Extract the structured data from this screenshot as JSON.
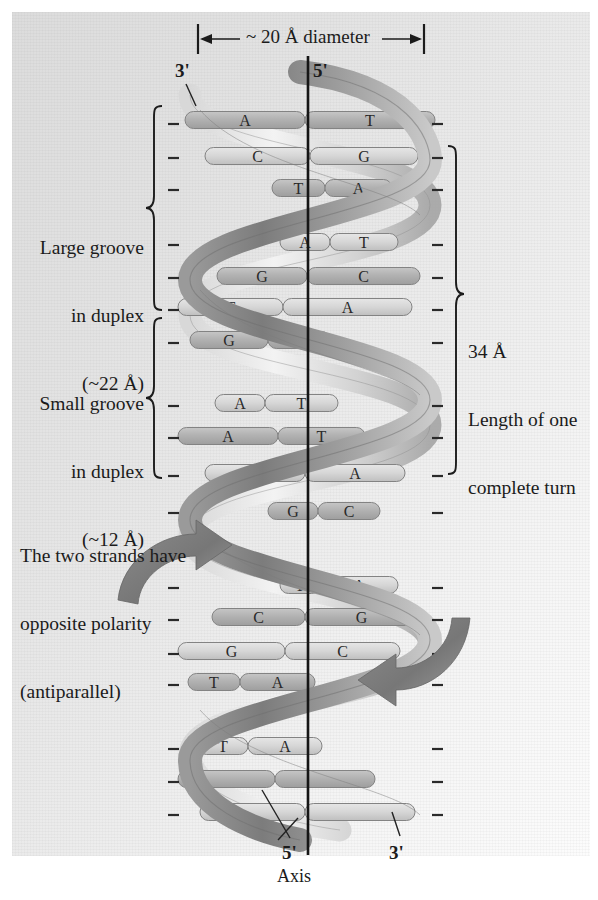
{
  "figure": {
    "background_color": "#e9e9e9",
    "ribbon_color_dark": "#8a8a8a",
    "ribbon_color_light": "#f2f2f2",
    "rung_color": "#b4b4b4",
    "text_color": "#1b1b1b"
  },
  "dimension_top": {
    "label": "~ 20 Å diameter",
    "arrow_left_x": 198,
    "arrow_right_x": 424
  },
  "strand_ends": {
    "top_left": "3'",
    "top_right": "5'",
    "bottom_left": "5'",
    "bottom_right": "3'"
  },
  "axis": {
    "label": "Axis",
    "x": 308,
    "top_y": 56,
    "bottom_y": 855
  },
  "annotations": {
    "large_groove": "Large groove\nin duplex\n(~22 Å)",
    "large_groove_lines": [
      "Large groove",
      "in duplex",
      "(~22 Å)"
    ],
    "small_groove": "Small groove\nin duplex\n(~12 Å)",
    "small_groove_lines": [
      "Small groove",
      "in duplex",
      "(~12 Å)"
    ],
    "antiparallel_lines": [
      "The two strands have",
      "opposite polarity",
      "(antiparallel)"
    ],
    "turn_length_lines": [
      "34 Å",
      "Length of one",
      "complete turn"
    ]
  },
  "chart_data": {
    "type": "diagram",
    "subtype": "dna-double-helix",
    "helix_diameter_angstrom": 20,
    "turn_length_angstrom": 34,
    "major_groove_angstrom": 22,
    "minor_groove_angstrom": 12,
    "base_pairs": [
      {
        "left": "A",
        "right": "T",
        "y": 120,
        "x1": 185,
        "x2": 435,
        "split": 305,
        "visible": "full"
      },
      {
        "left": "C",
        "right": "G",
        "y": 156,
        "x1": 205,
        "x2": 418,
        "split": 310,
        "visible": "full"
      },
      {
        "left": "T",
        "right": "A",
        "y": 188,
        "x1": 272,
        "x2": 392,
        "split": 325,
        "visible": "partial"
      },
      {
        "left": "A",
        "right": "T",
        "y": 242,
        "x1": 280,
        "x2": 398,
        "split": 330,
        "visible": "partial"
      },
      {
        "left": "G",
        "right": "C",
        "y": 276,
        "x1": 217,
        "x2": 420,
        "split": 307,
        "visible": "full"
      },
      {
        "left": "T",
        "right": "A",
        "y": 307,
        "x1": 178,
        "x2": 412,
        "split": 283,
        "visible": "full"
      },
      {
        "left": "G",
        "right": "C",
        "y": 340,
        "x1": 190,
        "x2": 330,
        "split": 268,
        "visible": "partial"
      },
      {
        "left": "A",
        "right": "T",
        "y": 403,
        "x1": 215,
        "x2": 338,
        "split": 265,
        "visible": "partial"
      },
      {
        "left": "A",
        "right": "T",
        "y": 436,
        "x1": 178,
        "x2": 365,
        "split": 278,
        "visible": "full"
      },
      {
        "left": "T",
        "right": "A",
        "y": 473,
        "x1": 205,
        "x2": 405,
        "split": 305,
        "visible": "full"
      },
      {
        "left": "G",
        "right": "C",
        "y": 511,
        "x1": 268,
        "x2": 380,
        "split": 318,
        "visible": "partial"
      },
      {
        "left": "T",
        "right": "A",
        "y": 585,
        "x1": 280,
        "x2": 398,
        "split": 320,
        "visible": "partial"
      },
      {
        "left": "C",
        "right": "G",
        "y": 617,
        "x1": 212,
        "x2": 418,
        "split": 305,
        "visible": "full"
      },
      {
        "left": "G",
        "right": "C",
        "y": 651,
        "x1": 178,
        "x2": 400,
        "split": 285,
        "visible": "full"
      },
      {
        "left": "T",
        "right": "A",
        "y": 682,
        "x1": 188,
        "x2": 315,
        "split": 240,
        "visible": "partial"
      },
      {
        "left": "T",
        "right": "A",
        "y": 746,
        "x1": 198,
        "x2": 322,
        "split": 248,
        "visible": "partial"
      },
      {
        "left": "",
        "right": "",
        "y": 779,
        "x1": 178,
        "x2": 375,
        "split": 275,
        "visible": "unlabeled"
      },
      {
        "left": "",
        "right": "",
        "y": 812,
        "x1": 200,
        "x2": 415,
        "split": 305,
        "visible": "unlabeled"
      }
    ],
    "backbone_ticks_left": [
      124,
      158,
      190,
      245,
      278,
      310,
      343,
      406,
      438,
      476,
      513,
      588,
      620,
      654,
      685,
      749,
      782,
      815
    ],
    "backbone_ticks_right": [
      124,
      158,
      190,
      245,
      278,
      310,
      343,
      406,
      438,
      476,
      513,
      588,
      620,
      654,
      685,
      749,
      782,
      815
    ]
  }
}
